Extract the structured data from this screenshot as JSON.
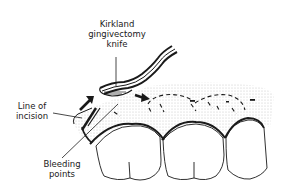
{
  "figure": {
    "labels": {
      "knife": [
        "Kirkland",
        "gingivectomy",
        "knife"
      ],
      "incision": [
        "Line of",
        "incision"
      ],
      "bleeding": [
        "Bleeding",
        "points"
      ]
    },
    "elements": {
      "teeth_count": 3,
      "knife": "kirkland-gingivectomy-knife",
      "arrows": [
        "incision-direction-arrow-left",
        "incision-direction-arrow-right"
      ],
      "dashed_line": "bleeding-points-dashed-line"
    },
    "colors": {
      "ink": "#1a1a1a",
      "gingiva_stipple": "#d9d9d9",
      "background": "#ffffff"
    }
  }
}
